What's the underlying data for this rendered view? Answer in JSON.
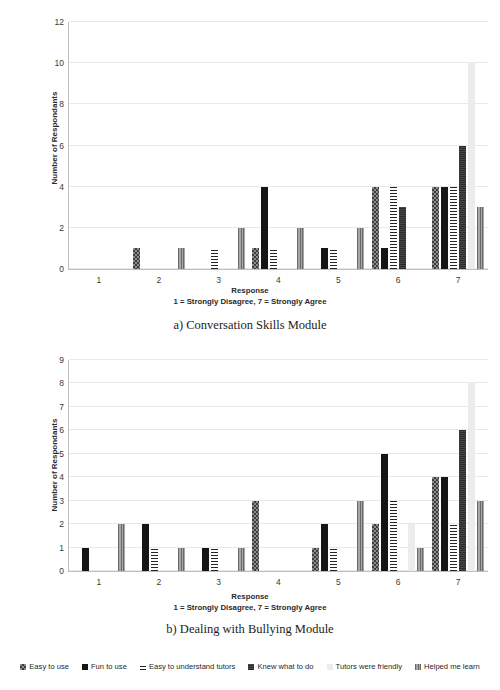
{
  "figure": {
    "legend": [
      {
        "label": "Easy to use",
        "swatch": "checkerboard-swatch",
        "color": "#8d8d8d"
      },
      {
        "label": "Fun to use",
        "swatch": "solid-dark-swatch",
        "color": "#151515"
      },
      {
        "label": "Easy to understand tutors",
        "swatch": "horizontal-stripe-swatch",
        "color": "#242424"
      },
      {
        "label": "Knew what to do",
        "swatch": "dark-gray-swatch",
        "color": "#3a3a3a"
      },
      {
        "label": "Tutors were friendly",
        "swatch": "light-gray-swatch",
        "color": "#ececec"
      },
      {
        "label": "Helped me learn",
        "swatch": "vertical-stripe-swatch",
        "color": "#8a8a8a"
      }
    ]
  },
  "chart_data": [
    {
      "type": "bar",
      "id": "conversation-skills",
      "title": "a) Conversation Skills Module",
      "xlabel": "Response",
      "xlabel_sub": "1 = Strongly Disagree, 7 = Strongly Agree",
      "ylabel": "Number of Respondants",
      "categories": [
        "1",
        "2",
        "3",
        "4",
        "5",
        "6",
        "7"
      ],
      "ylim": [
        0,
        12
      ],
      "yticks": [
        0,
        2,
        4,
        6,
        8,
        10,
        12
      ],
      "grid": true,
      "legend_position": "bottom",
      "series": [
        {
          "name": "Easy to use",
          "values": [
            0,
            1,
            0,
            1,
            0,
            4,
            4
          ]
        },
        {
          "name": "Fun to use",
          "values": [
            0,
            0,
            0,
            4,
            1,
            1,
            4
          ]
        },
        {
          "name": "Easy to understand tutors",
          "values": [
            0,
            0,
            1,
            1,
            1,
            4,
            4
          ]
        },
        {
          "name": "Knew what to do",
          "values": [
            0,
            0,
            0,
            0,
            0,
            3,
            6
          ]
        },
        {
          "name": "Tutors were friendly",
          "values": [
            0,
            0,
            0,
            0,
            0,
            0,
            10
          ]
        },
        {
          "name": "Helped me learn",
          "values": [
            0,
            1,
            2,
            2,
            2,
            0,
            3
          ]
        }
      ]
    },
    {
      "type": "bar",
      "id": "dealing-with-bullying",
      "title": "b) Dealing with Bullying Module",
      "xlabel": "Response",
      "xlabel_sub": "1 = Strongly Disagree, 7 = Strongly Agree",
      "ylabel": "Number of Respondants",
      "categories": [
        "1",
        "2",
        "3",
        "4",
        "5",
        "6",
        "7"
      ],
      "ylim": [
        0,
        9
      ],
      "yticks": [
        0,
        1,
        2,
        3,
        4,
        5,
        6,
        7,
        8,
        9
      ],
      "grid": true,
      "legend_position": "bottom",
      "series": [
        {
          "name": "Easy to use",
          "values": [
            0,
            0,
            0,
            3,
            1,
            2,
            4
          ]
        },
        {
          "name": "Fun to use",
          "values": [
            1,
            2,
            1,
            0,
            2,
            5,
            4
          ]
        },
        {
          "name": "Easy to understand tutors",
          "values": [
            0,
            1,
            1,
            0,
            1,
            3,
            2
          ]
        },
        {
          "name": "Knew what to do",
          "values": [
            0,
            0,
            0,
            0,
            0,
            0,
            6
          ]
        },
        {
          "name": "Tutors were friendly",
          "values": [
            0,
            0,
            0,
            0,
            0,
            2,
            8
          ]
        },
        {
          "name": "Helped me learn",
          "values": [
            2,
            1,
            1,
            0,
            3,
            1,
            3
          ]
        }
      ]
    }
  ]
}
